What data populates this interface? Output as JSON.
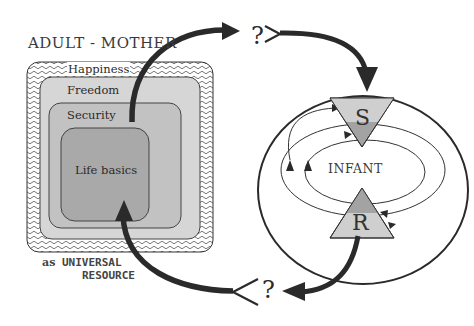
{
  "diagram": {
    "title": "ADULT - MOTHER",
    "levels": [
      {
        "id": "happiness",
        "label": "Happiness"
      },
      {
        "id": "freedom",
        "label": "Freedom"
      },
      {
        "id": "security",
        "label": "Security"
      },
      {
        "id": "basics",
        "label": "Life basics"
      }
    ],
    "resource_caption": {
      "prefix": "as",
      "line1": "UNIVERSAL",
      "line2": "RESOURCE"
    },
    "infant": {
      "label": "INFANT",
      "top_triangle": "S",
      "bottom_triangle": "R"
    },
    "connectors": {
      "top_question": "?",
      "bottom_question": "?"
    },
    "colors": {
      "outer_hatch": "#ffffff",
      "freedom_fill": "#d6d6d6",
      "security_fill": "#c2c2c2",
      "basics_fill": "#a6a6a6",
      "triangle_light": "#cfcfcf",
      "triangle_dark": "#a3a3a3",
      "arrow": "#2a2a2a"
    }
  }
}
